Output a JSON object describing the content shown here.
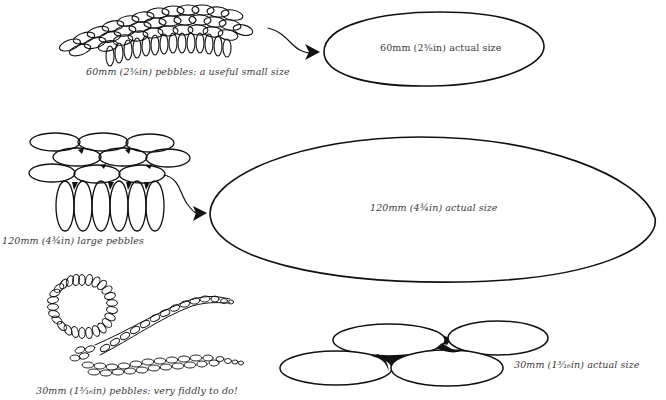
{
  "figure": {
    "type": "pebble-size-guide",
    "colors": {
      "ink": "#111111",
      "caption": "#3a3a3a",
      "background": "#ffffff"
    }
  },
  "sections": [
    {
      "id": "small",
      "sample_caption": "60mm (2⅜in) pebbles: a useful small size",
      "actual_caption": "60mm (2⅜in) actual size",
      "pebble_mm": 60,
      "pebble_in": "2⅜"
    },
    {
      "id": "large",
      "sample_caption": "120mm (4¾in) large pebbles",
      "actual_caption": "120mm (4¾in) actual size",
      "pebble_mm": 120,
      "pebble_in": "4¾"
    },
    {
      "id": "tiny",
      "sample_caption": "30mm (1³⁄₁₆in) pebbles: very fiddly to do!",
      "actual_caption": "30mm (1³⁄₁₆in) actual size",
      "pebble_mm": 30,
      "pebble_in": "1³⁄₁₆"
    }
  ],
  "icons": {
    "arrow_small": "curved-arrow-icon",
    "arrow_large": "curved-arrow-icon"
  }
}
